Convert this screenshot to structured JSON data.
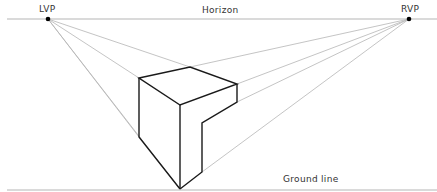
{
  "labels": {
    "lvp": "LVP",
    "rvp": "RVP",
    "horizon": "Horizon",
    "ground": "Ground line"
  },
  "colors": {
    "guide": "#b5b5b5",
    "object": "#1a1a1a",
    "point": "#000000",
    "text": "#333333"
  },
  "geometry": {
    "lvp": [
      48,
      19
    ],
    "rvp": [
      409,
      19
    ],
    "horizon_y": 19,
    "ground_y": 190,
    "cube": {
      "top_left": [
        139,
        78
      ],
      "top_back": [
        190,
        67
      ],
      "top_right": [
        237,
        84
      ],
      "top_front": [
        180,
        105
      ],
      "bottom_left": [
        139,
        137
      ],
      "bottom_front": [
        180,
        189
      ],
      "right_lower": [
        237,
        102
      ],
      "notch_top": [
        202,
        123
      ],
      "notch_bottom": [
        202,
        172
      ]
    }
  }
}
